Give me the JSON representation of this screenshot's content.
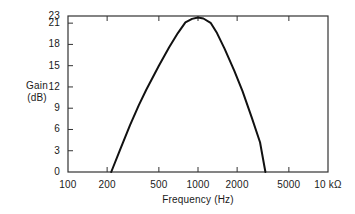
{
  "chart_data": {
    "type": "line",
    "title": "",
    "xlabel": "Frequency (Hz)",
    "ylabel": "Gain (dB)",
    "ylabel_line1": "Gain",
    "ylabel_line2": "(dB)",
    "xscale": "log",
    "xlim": [
      100,
      10000
    ],
    "ylim": [
      0,
      23
    ],
    "grid": false,
    "legend": null,
    "xticks": [
      100,
      200,
      500,
      1000,
      2000,
      5000,
      10000
    ],
    "xtick_labels": [
      "100",
      "200",
      "500",
      "1000",
      "2000",
      "5000",
      "10 kΩ"
    ],
    "yticks": [
      0,
      3,
      6,
      9,
      12,
      15,
      18,
      21,
      23
    ],
    "ytick_labels": [
      "0",
      "3",
      "6",
      "9",
      "12",
      "15",
      "18",
      "21",
      "23"
    ],
    "series": [
      {
        "name": "Gain response",
        "color": "#111111",
        "x": [
          215,
          250,
          300,
          350,
          400,
          500,
          600,
          700,
          800,
          900,
          1000,
          1100,
          1250,
          1400,
          1600,
          1900,
          2200,
          2600,
          3000,
          3300
        ],
        "values": [
          0.0,
          3.0,
          6.6,
          9.4,
          11.6,
          15.0,
          17.6,
          19.6,
          21.2,
          22.2,
          22.6,
          22.3,
          21.1,
          19.6,
          17.4,
          14.3,
          11.4,
          7.6,
          4.2,
          0.0
        ]
      }
    ],
    "annotations": {
      "peak_gain_db": 22.6,
      "peak_frequency_hz": 1000,
      "lower_zero_crossing_hz": 215,
      "upper_zero_crossing_hz": 3300
    }
  },
  "plot_frame": {
    "left": 68,
    "right": 328,
    "top": 16,
    "bottom": 172,
    "border_color": "#333333",
    "background": "#ffffff"
  }
}
